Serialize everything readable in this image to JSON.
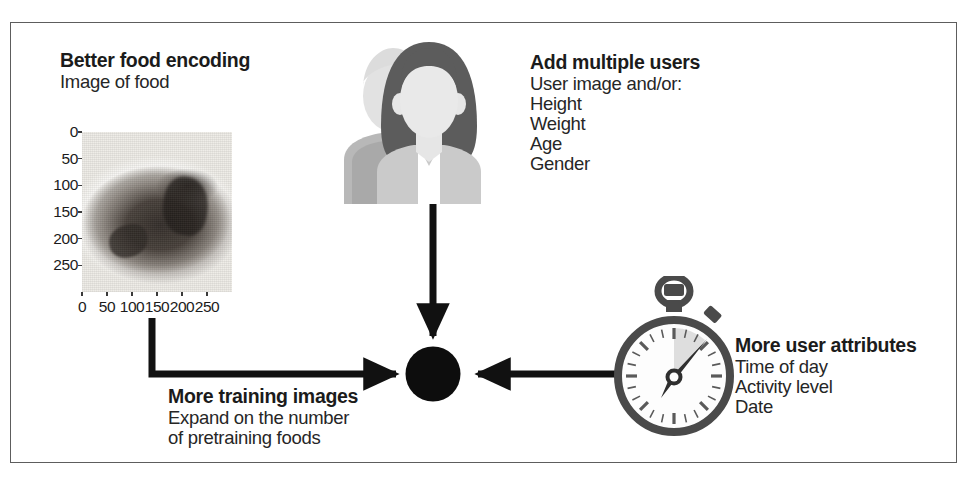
{
  "figure": {
    "border_color": "#5d5d5d",
    "ink_color": "#1b1b1b"
  },
  "blocks": {
    "food": {
      "title": "Better food encoding",
      "lines": [
        "Image of food"
      ]
    },
    "users": {
      "title": "Add multiple users",
      "lines": [
        "User image and/or:",
        "Height",
        "Weight",
        "Age",
        "Gender"
      ]
    },
    "attributes": {
      "title": "More user attributes",
      "lines": [
        "Time of day",
        "Activity level",
        "Date"
      ]
    },
    "training": {
      "title": "More training images",
      "lines": [
        "Expand on the number",
        "of pretraining foods"
      ]
    }
  },
  "food_plot": {
    "caption": "Image of food",
    "subject": "slice of chocolate cake on a white plate",
    "y_ticks": [
      "0",
      "50",
      "100",
      "150",
      "200",
      "250"
    ],
    "x_ticks": [
      "0",
      "50",
      "100",
      "150",
      "200",
      "250"
    ],
    "axis_max": 300
  },
  "icons": {
    "avatars": {
      "name": "two-users-icon",
      "back_person": "male silhouette",
      "front_person": "female silhouette",
      "colors": {
        "back": "#e0e0e0",
        "back_body": "#b6b6b6",
        "hair": "#5e5e5e",
        "face": "#e8e8e8",
        "body": "#c9c9c9",
        "shirt": "#ffffff"
      }
    },
    "stopwatch": {
      "name": "stopwatch-icon",
      "colors": {
        "ring": "#4a4a4a",
        "dial": "#fdfdfd",
        "hand": "#2f2f2f",
        "sector": "#dcdcdc"
      },
      "hand_angle_deg": 40
    },
    "hub": {
      "name": "central-hub-node",
      "color": "#0d0d0d"
    }
  },
  "arrows": {
    "color": "#111111",
    "items": [
      {
        "name": "arrow-food-to-hub",
        "direction": "elbow-down-right"
      },
      {
        "name": "arrow-users-to-hub",
        "direction": "down"
      },
      {
        "name": "arrow-attributes-to-hub",
        "direction": "left"
      }
    ]
  }
}
